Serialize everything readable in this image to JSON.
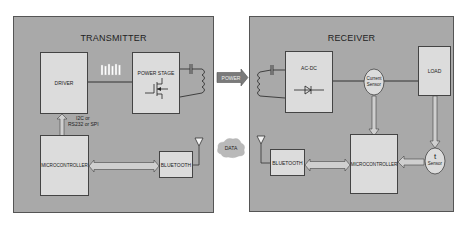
{
  "transmitter": {
    "title": "TRANSMITTER",
    "driver_label": "DRIVER",
    "power_stage_label": "POWER STAGE",
    "microcontroller_label": "MICROCONTROLLER",
    "bluetooth_label": "BLUETOOTH",
    "interface_label_line1": "I2C or",
    "interface_label_line2": "RS232 or SPI"
  },
  "link": {
    "power_label": "POWER",
    "data_label": "DATA"
  },
  "receiver": {
    "title": "RECEIVER",
    "acdc_label": "AC-DC",
    "current_sensor_line1": "Current",
    "current_sensor_line2": "Sensor",
    "load_label": "LOAD",
    "bluetooth_label": "BLUETOOTH",
    "microcontroller_label": "MICROCONTROLLER",
    "temp_sensor_symbol": "t",
    "temp_sensor_label": "Sensor"
  },
  "colors": {
    "frame_fill": "#a9a9a9",
    "block_fill": "#dcdcdc",
    "arrow_fill": "#cfcfcf",
    "line": "#444444",
    "power_arrow": "#7a7a7a"
  }
}
